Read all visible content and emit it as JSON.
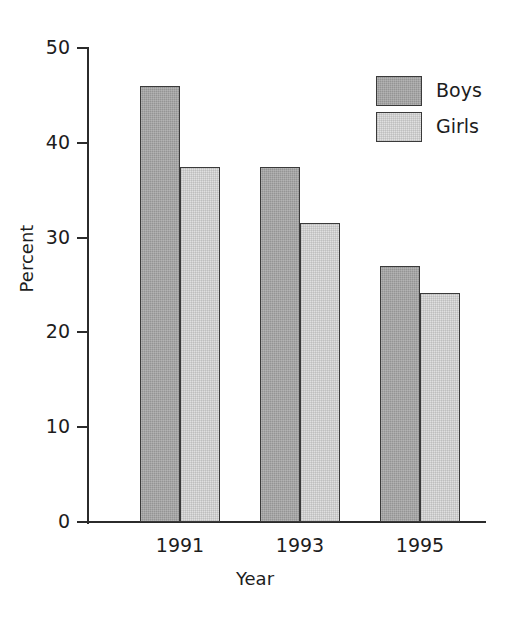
{
  "chart_data": {
    "type": "bar",
    "title": "",
    "subtitle": "",
    "xlabel": "Year",
    "ylabel": "Percent",
    "categories": [
      "1991",
      "1993",
      "1995"
    ],
    "series": [
      {
        "name": "Boys",
        "color": "#949494",
        "values": [
          46.0,
          37.4,
          27.0
        ]
      },
      {
        "name": "Girls",
        "color": "#e0e0e0",
        "values": [
          37.5,
          31.5,
          24.2
        ]
      }
    ],
    "ylim": [
      0,
      50
    ],
    "yticks": [
      0,
      10,
      20,
      30,
      40,
      50
    ],
    "ytick_labels": [
      "0",
      "10",
      "20",
      "30",
      "40",
      "50"
    ],
    "grid": false,
    "legend_position": "top-right",
    "border_color": "#3a3a3a",
    "axis_color": "#2b2b2b"
  },
  "legend": {
    "entries": [
      {
        "label": "Boys"
      },
      {
        "label": "Girls"
      }
    ]
  },
  "axes": {
    "y_title": "Percent",
    "x_title": "Year"
  }
}
